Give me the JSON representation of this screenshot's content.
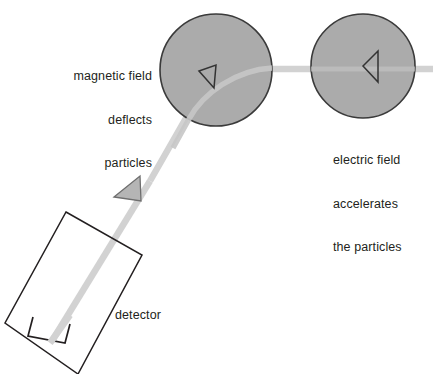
{
  "diagram": {
    "background_color": "#ffffff",
    "stroke_color": "#231f20",
    "beam_color": "#d2d2d2",
    "field_fill_color": "#ababab",
    "arrow_fill_color": "#b5b5b5"
  },
  "labels": {
    "magnetic": {
      "line1": "magnetic field",
      "line2": "deflects",
      "line3": "particles"
    },
    "electric": {
      "line1": "electric field",
      "line2": "accelerates",
      "line3": "the particles"
    },
    "detector": "detector"
  },
  "elements": {
    "magnetic_field_region": {
      "name": "magnetic field region",
      "shape": "circle",
      "cx": 216,
      "cy": 70,
      "r": 56
    },
    "electric_field_region": {
      "name": "electric field region",
      "shape": "circle",
      "cx": 363,
      "cy": 66,
      "r": 52
    },
    "detector_box": {
      "name": "detector",
      "shape": "rotated rectangle",
      "corners": "66,212 142,255 78,374 5,323"
    },
    "beam": {
      "name": "particle beam path",
      "direction": "right to lower-left",
      "thickness": 6
    },
    "direction_arrows": [
      {
        "name": "beam direction arrow",
        "style": "filled",
        "x": 128,
        "y": 190
      },
      {
        "name": "magnetic field direction marker",
        "style": "outline",
        "x": 208,
        "y": 78
      },
      {
        "name": "electric field direction marker",
        "style": "outline",
        "x": 370,
        "y": 66
      }
    ]
  }
}
